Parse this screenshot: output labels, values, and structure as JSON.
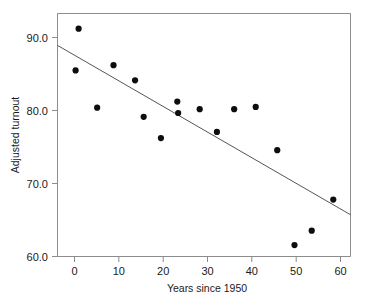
{
  "chart_data": {
    "type": "scatter",
    "title": "",
    "xlabel": "Years since 1950",
    "ylabel": "Adjusted turnout",
    "xlim": [
      -4,
      64
    ],
    "ylim": [
      60.0,
      92.0
    ],
    "xticks": [
      0,
      10,
      20,
      30,
      40,
      50,
      60
    ],
    "xtick_labels": [
      "0",
      "10",
      "20",
      "30",
      "40",
      "50",
      "60"
    ],
    "yticks": [
      60.0,
      70.0,
      80.0,
      90.0
    ],
    "ytick_labels": [
      "60.0",
      "70.0",
      "80.0",
      "90.0"
    ],
    "grid": false,
    "legend": null,
    "x": [
      0.9,
      0.2,
      5.2,
      9.0,
      14.0,
      16.0,
      20.0,
      23.8,
      24.0,
      29.0,
      33.0,
      37.0,
      42.0,
      47.0,
      51.0,
      55.0,
      60.0
    ],
    "y": [
      90.0,
      84.5,
      79.6,
      85.2,
      83.2,
      78.4,
      75.6,
      80.4,
      78.9,
      79.4,
      76.4,
      79.4,
      79.7,
      74.0,
      61.5,
      63.4,
      67.5
    ],
    "points": [
      {
        "x": 0.9,
        "y": 90.0
      },
      {
        "x": 0.2,
        "y": 84.5
      },
      {
        "x": 5.2,
        "y": 79.6
      },
      {
        "x": 9.0,
        "y": 85.2
      },
      {
        "x": 14.0,
        "y": 83.2
      },
      {
        "x": 16.0,
        "y": 78.4
      },
      {
        "x": 20.0,
        "y": 75.6
      },
      {
        "x": 23.8,
        "y": 80.4
      },
      {
        "x": 24.0,
        "y": 78.9
      },
      {
        "x": 29.0,
        "y": 79.4
      },
      {
        "x": 33.0,
        "y": 76.4
      },
      {
        "x": 37.0,
        "y": 79.4
      },
      {
        "x": 42.0,
        "y": 79.7
      },
      {
        "x": 47.0,
        "y": 74.0
      },
      {
        "x": 51.0,
        "y": 61.5
      },
      {
        "x": 55.0,
        "y": 63.4
      },
      {
        "x": 60.0,
        "y": 67.5
      }
    ],
    "trend_line": {
      "label": "linear fit",
      "x_start": -4,
      "y_start": 87.8,
      "x_end": 64,
      "y_end": 65.5,
      "slope": -0.328,
      "intercept": 86.49
    },
    "marker": {
      "shape": "circle",
      "radius_px": 3.1,
      "color": "#0d0d0d"
    },
    "colors": {
      "point": "#0d0d0d",
      "line": "#555555",
      "frame": "#8c8c8c",
      "text": "#1a1a1a",
      "background": "#ffffff"
    }
  }
}
